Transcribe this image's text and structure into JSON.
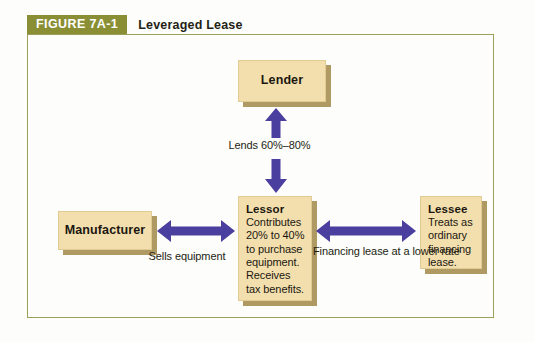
{
  "figure": {
    "number": "FIGURE 7A-1",
    "caption": "Leveraged Lease",
    "frame_border_color": "#9aa05a",
    "title_bar_color": "#8a8f35",
    "box_fill_color": "#f3dfae",
    "box_shadow_color": "#b09a63",
    "arrow_color": "#4a3f9e"
  },
  "nodes": {
    "lender": {
      "title": "Lender",
      "body": ""
    },
    "lessor": {
      "title": "Lessor",
      "body": "Contributes 20% to 40% to purchase equipment. Receives tax benefits."
    },
    "manufacturer": {
      "title": "Manufacturer",
      "body": ""
    },
    "lessee": {
      "title": "Lessee",
      "body": "Treats as ordinary financing lease."
    }
  },
  "edges": {
    "lender_lessor": {
      "label": "Lends 60%–80%",
      "direction": "bidirectional-vertical",
      "from": "Lessor",
      "to": "Lender"
    },
    "manufacturer_lessor": {
      "label": "Sells equipment",
      "direction": "bidirectional-horizontal",
      "from": "Lessor",
      "to": "Manufacturer"
    },
    "lessor_lessee": {
      "label": "Financing lease at a lower rate",
      "direction": "bidirectional-horizontal",
      "from": "Lessor",
      "to": "Lessee"
    }
  }
}
